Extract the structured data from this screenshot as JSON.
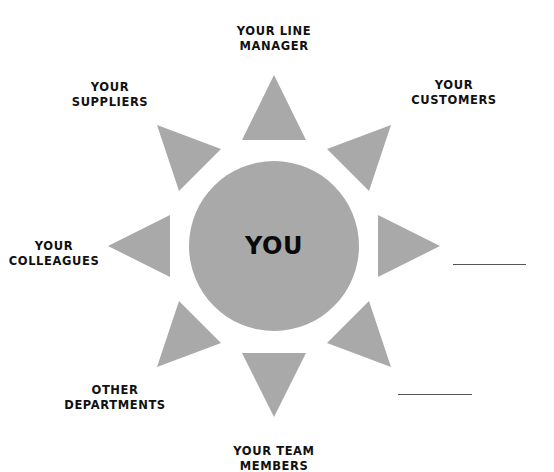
{
  "diagram": {
    "center": {
      "label": "YOU",
      "cx": 274,
      "cy": 246,
      "r": 85
    },
    "colors": {
      "shape_fill": "#a9a9a9",
      "text": "#111111",
      "line": "#555555",
      "background": "#ffffff"
    },
    "nodes": [
      {
        "id": "line-manager",
        "lines": [
          "YOUR LINE",
          "MANAGER"
        ]
      },
      {
        "id": "customers",
        "lines": [
          "YOUR",
          "CUSTOMERS"
        ]
      },
      {
        "id": "blank-right",
        "lines": [
          ""
        ]
      },
      {
        "id": "blank-bottom-right",
        "lines": [
          ""
        ]
      },
      {
        "id": "team-members",
        "lines": [
          "YOUR TEAM",
          "MEMBERS"
        ]
      },
      {
        "id": "other-departments",
        "lines": [
          "OTHER",
          "DEPARTMENTS"
        ]
      },
      {
        "id": "colleagues",
        "lines": [
          "YOUR",
          "COLLEAGUES"
        ]
      },
      {
        "id": "suppliers",
        "lines": [
          "YOUR",
          "SUPPLIERS"
        ]
      }
    ],
    "triangles": [
      {
        "direction": "up",
        "points": "274,75 242,140 306,140"
      },
      {
        "direction": "up-right",
        "points": "391,125 327,149 369,191"
      },
      {
        "direction": "right",
        "points": "440,246 378,215 378,277"
      },
      {
        "direction": "down-right",
        "points": "391,367 327,343 369,301"
      },
      {
        "direction": "down",
        "points": "274,417 242,353 306,353"
      },
      {
        "direction": "down-left",
        "points": "157,367 221,343 179,301"
      },
      {
        "direction": "left",
        "points": "108,246 170,215 170,277"
      },
      {
        "direction": "up-left",
        "points": "157,125 221,149 179,191"
      }
    ]
  }
}
